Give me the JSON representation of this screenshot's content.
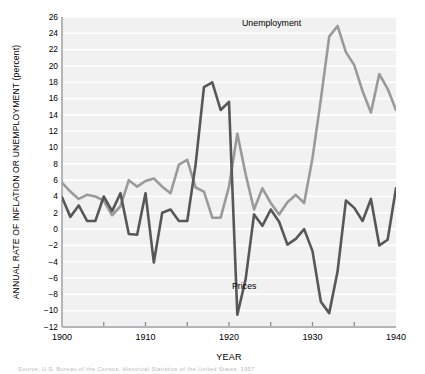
{
  "figure": {
    "ylabel": "ANNUAL RATE OF INFLATION OR UNEMPLOYMENT (percent)",
    "xlabel": "YEAR",
    "caption": "Source: U.S. Bureau of the Census, Historical Statistics of the United States, 1957",
    "labels": {
      "unemployment": "Unemployment",
      "prices": "Prices"
    },
    "colors": {
      "unemployment": "#9a9a9a",
      "prices": "#575757",
      "plot_background": "#f1f1f1",
      "gridline": "#ffffff",
      "axis": "#b5b5b5",
      "text": "#000000"
    }
  },
  "chart_data": {
    "type": "line",
    "title": "",
    "xlabel": "YEAR",
    "ylabel": "ANNUAL RATE OF INFLATION OR UNEMPLOYMENT (percent)",
    "xlim": [
      1900,
      1940
    ],
    "ylim": [
      -12,
      26
    ],
    "ytick_step": 2,
    "yticks": [
      -12,
      -10,
      -8,
      -6,
      -4,
      -2,
      0,
      2,
      4,
      6,
      8,
      10,
      12,
      14,
      16,
      18,
      20,
      22,
      24,
      26
    ],
    "xticks": [
      1900,
      1910,
      1920,
      1930,
      1940
    ],
    "xminor_ticks": [
      1905,
      1915,
      1925,
      1935
    ],
    "grid": "horizontal",
    "legend": "inline-annotations",
    "x": [
      1900,
      1901,
      1902,
      1903,
      1904,
      1905,
      1906,
      1907,
      1908,
      1909,
      1910,
      1911,
      1912,
      1913,
      1914,
      1915,
      1916,
      1917,
      1918,
      1919,
      1920,
      1921,
      1922,
      1923,
      1924,
      1925,
      1926,
      1927,
      1928,
      1929,
      1930,
      1931,
      1932,
      1933,
      1934,
      1935,
      1936,
      1937,
      1938,
      1939,
      1940
    ],
    "series": [
      {
        "name": "Unemployment",
        "color": "#9a9a9a",
        "values": [
          5.7,
          4.6,
          3.7,
          4.2,
          4.0,
          3.5,
          1.7,
          2.8,
          6.0,
          5.2,
          5.9,
          6.2,
          5.2,
          4.4,
          7.9,
          8.5,
          5.1,
          4.6,
          1.4,
          1.4,
          5.2,
          11.7,
          6.7,
          2.4,
          5.0,
          3.2,
          1.8,
          3.3,
          4.2,
          3.2,
          8.7,
          15.9,
          23.6,
          24.9,
          21.7,
          20.1,
          16.9,
          14.3,
          19.0,
          17.2,
          14.6
        ]
      },
      {
        "name": "Prices",
        "color": "#575757",
        "values": [
          3.9,
          1.5,
          2.9,
          1.0,
          1.0,
          4.0,
          2.2,
          4.4,
          -0.6,
          -0.7,
          4.4,
          -4.1,
          2.0,
          2.4,
          1.0,
          1.0,
          7.9,
          17.4,
          18.0,
          14.6,
          15.6,
          -10.5,
          -6.1,
          1.8,
          0.4,
          2.4,
          0.9,
          -1.9,
          -1.2,
          0.0,
          -2.7,
          -8.9,
          -10.3,
          -5.2,
          3.5,
          2.6,
          1.0,
          3.7,
          -2.0,
          -1.3,
          5.0
        ]
      }
    ]
  }
}
